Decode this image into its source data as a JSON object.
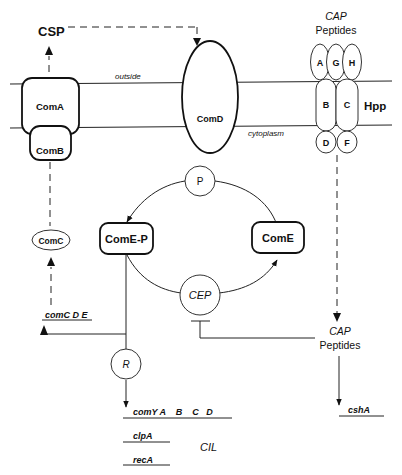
{
  "diagram": {
    "regions": {
      "outside": "outside",
      "cytoplasm": "cytoplasm"
    },
    "nodes": {
      "csp": "CSP",
      "comA": "ComA",
      "comB": "ComB",
      "comC": "ComC",
      "comD": "ComD",
      "p": "P",
      "comEP": "ComE-P",
      "comE": "ComE",
      "cep": "CEP",
      "r": "R",
      "hpp": "Hpp",
      "hpp_subunits": [
        "A",
        "G",
        "H",
        "B",
        "C",
        "D",
        "F"
      ]
    },
    "cap_top": {
      "line1": "CAP",
      "line2": "Peptides"
    },
    "cap_mid": {
      "line1": "CAP",
      "line2": "Peptides"
    },
    "genes": {
      "comCDE": "comC D E",
      "comY": "comY A    B    C   D",
      "clpA": "clpA",
      "recA": "recA",
      "cshA": "cshA"
    },
    "cil_label": "CIL"
  }
}
